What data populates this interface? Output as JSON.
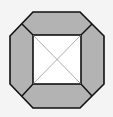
{
  "diagram": {
    "colors": {
      "background": "#f4f4f4",
      "trapezoid_fill": "#b3b3b3",
      "inner_square_fill": "#ffffff",
      "stroke": "#111111",
      "diagonal": "#8a8a8a"
    },
    "outer_octagon": [
      [
        33,
        12
      ],
      [
        80,
        12
      ],
      [
        104,
        36
      ],
      [
        104,
        84
      ],
      [
        80,
        108
      ],
      [
        33,
        108
      ],
      [
        10,
        84
      ],
      [
        10,
        36
      ]
    ],
    "inner_square": {
      "x": 33,
      "y": 35,
      "width": 48,
      "height": 49
    },
    "trapezoids": [
      {
        "name": "top",
        "points": [
          [
            33,
            12
          ],
          [
            80,
            12
          ],
          [
            90,
            25
          ],
          [
            81,
            35
          ],
          [
            33,
            35
          ],
          [
            22,
            25
          ]
        ]
      },
      {
        "name": "right",
        "points": [
          [
            90,
            25
          ],
          [
            104,
            36
          ],
          [
            104,
            84
          ],
          [
            90,
            96
          ],
          [
            81,
            84
          ],
          [
            81,
            35
          ]
        ]
      },
      {
        "name": "bottom",
        "points": [
          [
            33,
            84
          ],
          [
            81,
            84
          ],
          [
            90,
            96
          ],
          [
            80,
            108
          ],
          [
            33,
            108
          ],
          [
            22,
            96
          ]
        ]
      },
      {
        "name": "left",
        "points": [
          [
            22,
            25
          ],
          [
            33,
            35
          ],
          [
            33,
            84
          ],
          [
            22,
            96
          ],
          [
            10,
            84
          ],
          [
            10,
            36
          ]
        ]
      }
    ]
  }
}
